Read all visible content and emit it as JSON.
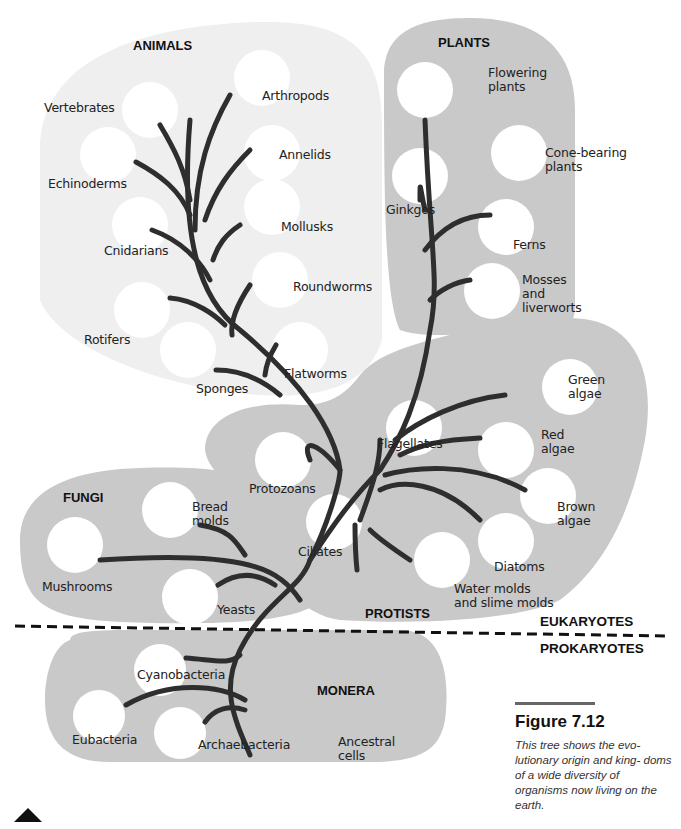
{
  "figure": {
    "number": "Figure 7.12",
    "caption": "This tree shows the evo-\nlutionary origin and king-\ndoms of a wide diversity\nof organisms now living\non the earth."
  },
  "domains": {
    "upper": "EUKARYOTES",
    "lower": "PROKARYOTES"
  },
  "kingdoms": {
    "animals": {
      "name": "ANIMALS",
      "groups": [
        "Vertebrates",
        "Arthropods",
        "Annelids",
        "Echinoderms",
        "Mollusks",
        "Cnidarians",
        "Roundworms",
        "Rotifers",
        "Flatworms",
        "Sponges"
      ]
    },
    "plants": {
      "name": "PLANTS",
      "groups": [
        "Flowering\nplants",
        "Cone-bearing\nplants",
        "Ginkgos",
        "Ferns",
        "Mosses\nand\nliverworts"
      ]
    },
    "protists": {
      "name": "PROTISTS",
      "groups": [
        "Green\nalgae",
        "Flagellates",
        "Red\nalgae",
        "Protozoans",
        "Brown\nalgae",
        "Ciliates",
        "Diatoms",
        "Water molds\nand slime molds"
      ]
    },
    "fungi": {
      "name": "FUNGI",
      "groups": [
        "Bread\nmolds",
        "Mushrooms",
        "Yeasts"
      ]
    },
    "monera": {
      "name": "MONERA",
      "groups": [
        "Cyanobacteria",
        "Eubacteria",
        "Archaebacteria"
      ]
    }
  },
  "root_label": "Ancestral\ncells",
  "colors": {
    "animals_bg": "#efefef",
    "region_bg": "#c9c9c9",
    "branch": "#2e2e2e",
    "bubble": "#ffffff"
  }
}
